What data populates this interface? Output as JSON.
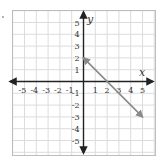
{
  "chart_data": {
    "type": "line",
    "title": "",
    "xlabel": "x",
    "ylabel": "y",
    "xlim": [
      -5,
      5
    ],
    "ylim": [
      -5,
      5
    ],
    "grid": true,
    "x_ticks": [
      -5,
      -4,
      -3,
      -2,
      -1,
      1,
      2,
      3,
      4,
      5
    ],
    "y_ticks": [
      5,
      4,
      3,
      2,
      1,
      -1,
      -2,
      -3,
      -4,
      -5
    ],
    "x_tick_labels": [
      "-5",
      "-4",
      "-3",
      "-2",
      "-1",
      "1",
      "2",
      "3",
      "4",
      "5"
    ],
    "y_tick_labels": [
      "5",
      "4",
      "3",
      "2",
      "1",
      "-1",
      "-2",
      "-3",
      "-4",
      "-5"
    ],
    "series": [
      {
        "name": "line",
        "x": [
          0,
          5
        ],
        "y": [
          2,
          -3
        ],
        "arrows": "both",
        "color": "#8a8a8a"
      }
    ],
    "legend": null
  },
  "colors": {
    "grid": "#dcdcdc",
    "axis": "#222222",
    "border": "#bdbdbd",
    "line": "#8a8a8a"
  },
  "labels": {
    "x_axis": "x",
    "y_axis": "y"
  }
}
